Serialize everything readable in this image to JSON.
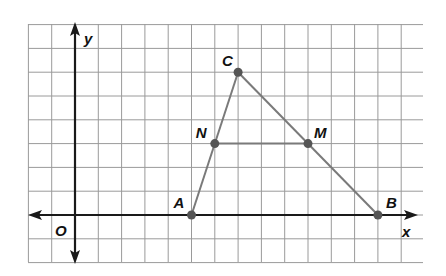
{
  "diagram": {
    "type": "coordinate-plane-triangle",
    "grid": {
      "x_min": -2,
      "x_max": 14,
      "y_min": -2,
      "y_max": 8,
      "origin_px": [
        75,
        215
      ],
      "unit_px": [
        23.3,
        23.8
      ],
      "line_color": "#9a9a9a",
      "axis_color": "#1a1a1a"
    },
    "axes": {
      "x_label": "x",
      "y_label": "y",
      "origin_label": "O"
    },
    "points": [
      {
        "name": "A",
        "x": 5,
        "y": 0,
        "label": "A"
      },
      {
        "name": "B",
        "x": 13,
        "y": 0,
        "label": "B"
      },
      {
        "name": "C",
        "x": 7,
        "y": 6,
        "label": "C"
      },
      {
        "name": "N",
        "x": 6,
        "y": 3,
        "label": "N"
      },
      {
        "name": "M",
        "x": 10,
        "y": 3,
        "label": "M"
      }
    ],
    "segments": [
      {
        "from": "A",
        "to": "C"
      },
      {
        "from": "C",
        "to": "B"
      },
      {
        "from": "A",
        "to": "B"
      },
      {
        "from": "N",
        "to": "M"
      }
    ],
    "segment_color": "#7a7a7a",
    "point_color": "#555555"
  }
}
